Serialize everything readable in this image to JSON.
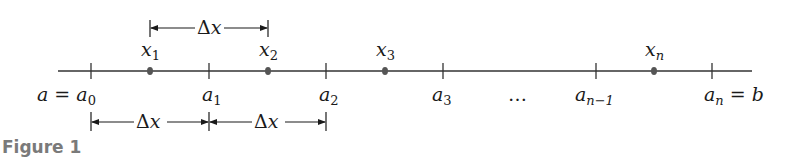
{
  "figure": {
    "caption": "Figure 1",
    "axis": {
      "x_start": 58,
      "x_end": 752,
      "y": 71,
      "color": "#333333"
    },
    "ticks": [
      {
        "id": "a0",
        "x": 91,
        "label_main": "a = a",
        "label_sub": "0",
        "label_suffix": ""
      },
      {
        "id": "a1",
        "x": 209,
        "label_main": "a",
        "label_sub": "1",
        "label_suffix": ""
      },
      {
        "id": "a2",
        "x": 326,
        "label_main": "a",
        "label_sub": "2",
        "label_suffix": ""
      },
      {
        "id": "a3",
        "x": 443,
        "label_main": "a",
        "label_sub": "3",
        "label_suffix": ""
      },
      {
        "id": "an-1",
        "x": 596,
        "label_main": "a",
        "label_sub": "n−1",
        "label_suffix": ""
      },
      {
        "id": "an",
        "x": 712,
        "label_main": "a",
        "label_sub": "n",
        "label_suffix": " = b"
      }
    ],
    "ellipsis": "…",
    "sample_points": [
      {
        "id": "x1",
        "x": 150,
        "label_main": "x",
        "label_sub": "1"
      },
      {
        "id": "x2",
        "x": 268,
        "label_main": "x",
        "label_sub": "2"
      },
      {
        "id": "x3",
        "x": 385,
        "label_main": "x",
        "label_sub": "3"
      },
      {
        "id": "xn",
        "x": 654,
        "label_main": "x",
        "label_sub": "n"
      }
    ],
    "brackets": [
      {
        "position": "top",
        "from": "x1",
        "to": "x2",
        "label": "Δx"
      },
      {
        "position": "bottom",
        "from": "a0",
        "to": "a1",
        "label": "Δx"
      },
      {
        "position": "bottom",
        "from": "a1",
        "to": "a2",
        "label": "Δx"
      }
    ],
    "delta_symbol": "Δ",
    "delta_var": "x"
  }
}
